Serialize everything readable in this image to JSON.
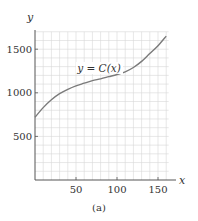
{
  "chart_data": {
    "type": "line",
    "title": "",
    "caption": "(a)",
    "xlabel": "x",
    "ylabel": "y",
    "xlim": [
      0,
      160
    ],
    "ylim": [
      0,
      1700
    ],
    "x_ticks": [
      50,
      100,
      150
    ],
    "y_ticks": [
      500,
      1000,
      1500
    ],
    "x_tick_labels": [
      "50",
      "100",
      "150"
    ],
    "y_tick_labels": [
      "500",
      "1000",
      "1500"
    ],
    "grid": true,
    "grid_minor_x_step": 10,
    "grid_minor_y_step": 100,
    "annotations": [
      {
        "text": "y = C(x)",
        "x": 70,
        "y": 1300
      }
    ],
    "series": [
      {
        "name": "y = C(x)",
        "x": [
          0,
          10,
          20,
          30,
          40,
          50,
          60,
          70,
          80,
          90,
          100,
          110,
          120,
          130,
          140,
          150,
          160
        ],
        "values": [
          720,
          830,
          920,
          990,
          1040,
          1080,
          1110,
          1140,
          1160,
          1185,
          1210,
          1240,
          1290,
          1360,
          1450,
          1540,
          1650
        ]
      }
    ]
  },
  "labels": {
    "x_axis": "x",
    "y_axis": "y",
    "curve": "y = C(x)",
    "caption": "(a)",
    "xt0": "50",
    "xt1": "100",
    "xt2": "150",
    "yt0": "500",
    "yt1": "1000",
    "yt2": "1500"
  },
  "colors": {
    "curve": "#7a7a7a",
    "grid": "#d6d6d6",
    "axis": "#555555",
    "text": "#333333"
  }
}
